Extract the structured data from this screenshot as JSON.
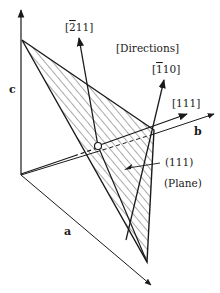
{
  "diagram": {
    "axes": {
      "a": "a",
      "b": "b",
      "c": "c"
    },
    "directions_label": "[Directions]",
    "directions": {
      "d211": {
        "open": "[",
        "bar": "2",
        "rest": "11]"
      },
      "d110": {
        "open": "[",
        "bar": "1",
        "rest": "10]"
      },
      "d111": "[111]"
    },
    "plane_label": "(111)",
    "plane_caption": "(Plane)",
    "colors": {
      "line": "#1a1a1a",
      "hatch": "#2a2a2a",
      "background": "#ffffff"
    }
  }
}
